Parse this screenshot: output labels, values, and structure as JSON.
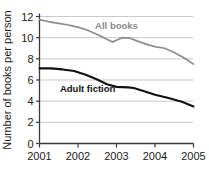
{
  "chart_data": {
    "type": "line",
    "title": "",
    "xlabel": "",
    "ylabel": "Number of books per person",
    "xlim": [
      2001,
      2005
    ],
    "ylim": [
      0,
      12
    ],
    "grid": true,
    "legend_position": "inline-labels",
    "xticks": [
      "2001",
      "2002",
      "2003",
      "2004",
      "2005"
    ],
    "yticks": [
      "0",
      "2",
      "4",
      "6",
      "8",
      "10",
      "12"
    ],
    "x": [
      2001,
      2005
    ],
    "series": [
      {
        "name": "All books",
        "color": "#8c8c8c",
        "label_x": 2003.0,
        "label_y": 10.85,
        "points": [
          [
            2001.0,
            11.7
          ],
          [
            2001.25,
            11.5
          ],
          [
            2001.5,
            11.35
          ],
          [
            2001.75,
            11.2
          ],
          [
            2002.0,
            11.0
          ],
          [
            2002.25,
            10.7
          ],
          [
            2002.5,
            10.3
          ],
          [
            2002.75,
            9.85
          ],
          [
            2002.9,
            9.6
          ],
          [
            2003.0,
            9.75
          ],
          [
            2003.15,
            10.0
          ],
          [
            2003.35,
            9.95
          ],
          [
            2003.6,
            9.6
          ],
          [
            2003.85,
            9.3
          ],
          [
            2004.0,
            9.15
          ],
          [
            2004.25,
            9.0
          ],
          [
            2004.5,
            8.6
          ],
          [
            2004.75,
            8.1
          ],
          [
            2005.0,
            7.5
          ]
        ]
      },
      {
        "name": "Adult fiction",
        "color": "#111111",
        "label_x": 2002.25,
        "label_y": 4.85,
        "points": [
          [
            2001.0,
            7.1
          ],
          [
            2001.3,
            7.1
          ],
          [
            2001.6,
            7.0
          ],
          [
            2001.9,
            6.85
          ],
          [
            2002.2,
            6.5
          ],
          [
            2002.5,
            6.05
          ],
          [
            2002.75,
            5.6
          ],
          [
            2003.0,
            5.35
          ],
          [
            2003.3,
            5.3
          ],
          [
            2003.45,
            5.25
          ],
          [
            2003.7,
            4.95
          ],
          [
            2004.0,
            4.6
          ],
          [
            2004.35,
            4.3
          ],
          [
            2004.7,
            3.95
          ],
          [
            2005.0,
            3.5
          ]
        ]
      }
    ]
  }
}
